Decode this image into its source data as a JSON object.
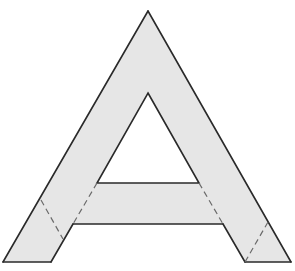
{
  "figure": {
    "colors": {
      "fill": "#e6e6e6",
      "stroke": "#2a2a2a",
      "dash": "#6a6a6a",
      "background": "#ffffff"
    },
    "outline_points": "148,11 291,262 245,262 223,224 73,224 51,262 3,262",
    "hole_points": "148,93 199,183 97,183",
    "solid_segments": [
      {
        "x1": 148,
        "y1": 11,
        "x2": 291,
        "y2": 262
      },
      {
        "x1": 291,
        "y1": 262,
        "x2": 245,
        "y2": 262
      },
      {
        "x1": 223,
        "y1": 224,
        "x2": 73,
        "y2": 224
      },
      {
        "x1": 51,
        "y1": 262,
        "x2": 3,
        "y2": 262
      },
      {
        "x1": 3,
        "y1": 262,
        "x2": 148,
        "y2": 11
      },
      {
        "x1": 73,
        "y1": 224,
        "x2": 51,
        "y2": 262
      },
      {
        "x1": 223,
        "y1": 224,
        "x2": 245,
        "y2": 262
      }
    ],
    "dashed_segments": [
      {
        "x1": 97,
        "y1": 183,
        "x2": 73,
        "y2": 224
      },
      {
        "x1": 199,
        "y1": 183,
        "x2": 223,
        "y2": 224
      },
      {
        "x1": 41,
        "y1": 200,
        "x2": 63,
        "y2": 239
      },
      {
        "x1": 268,
        "y1": 222,
        "x2": 245,
        "y2": 262
      }
    ]
  }
}
